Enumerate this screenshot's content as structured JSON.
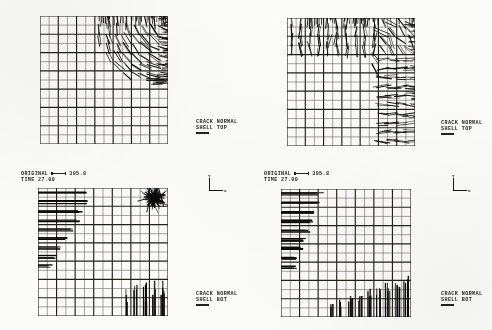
{
  "figure": {
    "background_color": "#fbfbfa",
    "ink_color": "#14120f"
  },
  "headers": [
    {
      "id": "header-bottom-left",
      "original_label": "ORIGINAL",
      "scale_value": "395.8",
      "time_label": "TIME 27.00"
    },
    {
      "id": "header-bottom-right",
      "original_label": "ORIGINAL",
      "scale_value": "395.8",
      "time_label": "TIME 27.00"
    }
  ],
  "captions": [
    {
      "id": "caption-top-left",
      "line1": "CRACK NORMAL",
      "line2": "SHELL TOP"
    },
    {
      "id": "caption-top-right",
      "line1": "CRACK NORMAL",
      "line2": "SHELL TOP"
    },
    {
      "id": "caption-bottom-left",
      "line1": "CRACK NORMAL",
      "line2": "SHELL BOT"
    },
    {
      "id": "caption-bottom-right",
      "line1": "CRACK NORMAL",
      "line2": "SHELL BOT"
    }
  ],
  "axis_triads": [
    {
      "id": "triad-bottom-left",
      "y_label": "Y",
      "x_label": "X"
    },
    {
      "id": "triad-bottom-right",
      "y_label": "Y",
      "x_label": "X"
    }
  ],
  "chart_data": {
    "type": "scatter",
    "xlabel": "X",
    "ylabel": "Y",
    "grid": true,
    "legend_position": "right",
    "mesh": {
      "columns": 14,
      "rows": 14,
      "heavy_line_every": 2,
      "note": "Square quarter-plate mesh, uniform cells, alternating heavy/light gridlines"
    },
    "panels": [
      {
        "name": "top-left",
        "surface": "SHELL TOP",
        "label": "CRACK NORMAL",
        "time": 27.0,
        "scale": 395.8,
        "crack_region": "upper-right quadrant",
        "description": "Dense fan of crack normals concentrated in the upper-right corner, radiating outward past the top and right mesh edges; crack zone spans roughly columns 7-14 and rows 10-14 with an arc-shaped inner boundary.",
        "vector_zone": {
          "x_start_col": 7,
          "x_end_col": 14,
          "y_start_row": 9,
          "y_end_row": 14
        },
        "dominant_orientation": "radial / fan",
        "density": "high"
      },
      {
        "name": "top-right",
        "surface": "SHELL TOP",
        "label": "CRACK NORMAL",
        "time": 27.0,
        "scale": 395.8,
        "crack_region": "top edge band plus right edge band",
        "description": "Crack normals form an L-shaped band: a dense horizontal band along the entire top edge (rows 12-14) joined by a concave arc to a vertical band along the right edge (columns 12-14); interior of the quarter-plate is uncracked.",
        "vector_zone": {
          "top_band_rows": [
            12,
            14
          ],
          "right_band_cols": [
            12,
            14
          ],
          "arc": "concave toward origin"
        },
        "dominant_orientation": "edge-normal",
        "density": "high"
      },
      {
        "name": "bottom-left",
        "surface": "SHELL BOT",
        "label": "CRACK NORMAL",
        "time": 27.0,
        "scale": 395.8,
        "crack_region": "upper-left horizontal hatch, upper-right radial burst, lower-right vertical hatch",
        "description": "Three distinct crack groups: long horizontal normals in the upper-left stepping down in a staircase, a tight radial starburst cluster at the upper-right corner, and a group of vertical normals at the lower-right corner extending below the mesh.",
        "groups": [
          {
            "id": "upper-left-horizontal",
            "orientation": "horizontal",
            "cols": [
              1,
              5
            ],
            "rows": [
              10,
              14
            ],
            "density": "medium-high"
          },
          {
            "id": "upper-right-burst",
            "orientation": "radial",
            "cols": [
              12,
              14
            ],
            "rows": [
              13,
              14
            ],
            "density": "very high"
          },
          {
            "id": "lower-right-vertical",
            "orientation": "vertical",
            "cols": [
              9,
              14
            ],
            "rows": [
              1,
              3
            ],
            "density": "medium-high"
          }
        ]
      },
      {
        "name": "bottom-right",
        "surface": "SHELL BOT",
        "label": "CRACK NORMAL",
        "time": 27.0,
        "scale": 395.8,
        "crack_region": "left edge horizontal hatch tapering downward, bottom edge vertical hatch rising to the right",
        "description": "Horizontal crack normals fill a left-edge column band whose extent tapers from wide at the top to narrow near mid-height; vertical crack normals fill a bottom-edge band whose height grows from left to right, extending below the mesh.",
        "groups": [
          {
            "id": "left-horizontal-taper",
            "orientation": "horizontal",
            "cols": [
              1,
              4
            ],
            "rows": [
              7,
              14
            ],
            "density": "high"
          },
          {
            "id": "bottom-vertical-ramp",
            "orientation": "vertical",
            "cols": [
              6,
              14
            ],
            "rows": [
              1,
              4
            ],
            "density": "high"
          }
        ]
      }
    ]
  }
}
